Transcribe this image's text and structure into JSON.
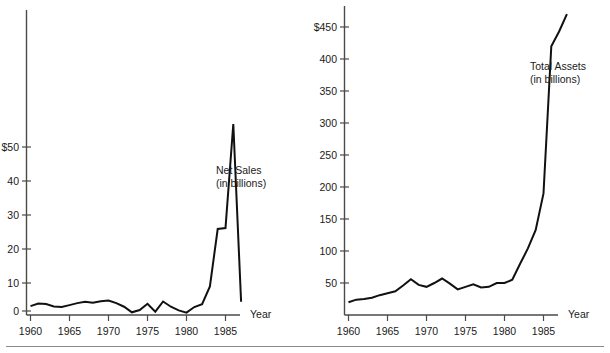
{
  "figure": {
    "background": "#ffffff",
    "line_color": "#111111",
    "axis_color": "#4a4a4a",
    "rule_color": "#8a8a8a"
  },
  "chart_data": [
    {
      "type": "line",
      "id": "net-sales",
      "title": "",
      "annotation": "Net Sales\n(in billions)",
      "annotation_line1": "Net Sales",
      "annotation_line2": "(in billions)",
      "xlabel": "Year",
      "ylabel": "",
      "ylim": [
        -3,
        62
      ],
      "xlim": [
        1959,
        1988.5
      ],
      "grid": false,
      "legend": false,
      "ytick_labels": [
        "$50",
        "40",
        "30",
        "20",
        "10",
        "0"
      ],
      "ytick_values": [
        50,
        40,
        30,
        20,
        10,
        0
      ],
      "xtick_labels": [
        "1960",
        "1965",
        "1970",
        "1975",
        "1980",
        "1985"
      ],
      "xtick_values": [
        1960,
        1965,
        1970,
        1975,
        1980,
        1985
      ],
      "x": [
        1960,
        1961,
        1962,
        1963,
        1964,
        1965,
        1966,
        1967,
        1968,
        1969,
        1970,
        1971,
        1972,
        1973,
        1974,
        1975,
        1976,
        1977,
        1978,
        1979,
        1980,
        1981,
        1982,
        1983,
        1984,
        1985,
        1986,
        1987
      ],
      "values": [
        1.5,
        2.3,
        2.1,
        1.4,
        1.2,
        1.8,
        2.4,
        2.8,
        2.5,
        3.0,
        3.2,
        2.4,
        1.3,
        -0.4,
        0.3,
        2.2,
        -0.2,
        2.9,
        1.3,
        0.2,
        -0.5,
        1.2,
        2.1,
        7.5,
        25.0,
        25.3,
        57.0,
        2.8
      ]
    },
    {
      "type": "line",
      "id": "total-assets",
      "title": "",
      "annotation": "Total Assets\n(in billions)",
      "annotation_line1": "Total Assets",
      "annotation_line2": "(in billions)",
      "xlabel": "Year",
      "ylabel": "",
      "ylim": [
        0,
        490
      ],
      "xlim": [
        1959,
        1988.5
      ],
      "grid": false,
      "legend": false,
      "ytick_labels": [
        "$450",
        "400",
        "350",
        "300",
        "250",
        "200",
        "150",
        "100",
        "50"
      ],
      "ytick_values": [
        450,
        400,
        350,
        300,
        250,
        200,
        150,
        100,
        50
      ],
      "xtick_labels": [
        "1960",
        "1965",
        "1970",
        "1975",
        "1980",
        "1985"
      ],
      "xtick_values": [
        1960,
        1965,
        1970,
        1975,
        1980,
        1985
      ],
      "x": [
        1960,
        1961,
        1962,
        1963,
        1964,
        1965,
        1966,
        1967,
        1968,
        1969,
        1970,
        1971,
        1972,
        1973,
        1974,
        1975,
        1976,
        1977,
        1978,
        1979,
        1980,
        1981,
        1982,
        1983,
        1984,
        1985,
        1986,
        1987,
        1988
      ],
      "values": [
        20,
        24,
        25,
        27,
        31,
        34,
        37,
        46,
        56,
        47,
        44,
        50,
        57,
        49,
        40,
        44,
        48,
        43,
        44,
        50,
        50,
        55,
        80,
        104,
        133,
        190,
        420,
        443,
        470
      ]
    }
  ],
  "left_chart": {
    "annotation_line1": "Net Sales",
    "annotation_line2": "(in billions)",
    "xaxis_title": "Year",
    "ytick_labels": [
      "$50",
      "40",
      "30",
      "20",
      "10",
      "0"
    ],
    "xtick_labels": [
      "1960",
      "1965",
      "1970",
      "1975",
      "1980",
      "1985"
    ]
  },
  "right_chart": {
    "annotation_line1": "Total Assets",
    "annotation_line2": "(in billions)",
    "xaxis_title": "Year",
    "ytick_labels": [
      "$450",
      "400",
      "350",
      "300",
      "250",
      "200",
      "150",
      "100",
      "50"
    ],
    "xtick_labels": [
      "1960",
      "1965",
      "1970",
      "1975",
      "1980",
      "1985"
    ]
  }
}
